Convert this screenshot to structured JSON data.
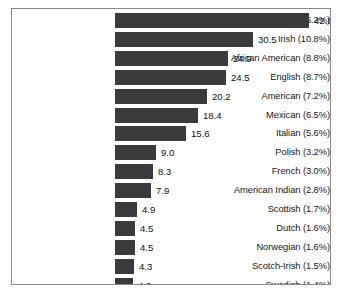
{
  "chart_data": {
    "type": "bar",
    "orientation": "horizontal",
    "title": "",
    "subtitle": "",
    "xlabel": "",
    "ylabel": "",
    "grid": false,
    "legend": null,
    "xlim": [
      0,
      42.8
    ],
    "value_format": "one-decimal",
    "bar_color": "#3b3b3b",
    "frame_color": "#8a8a8a",
    "background_color": "#ffffff",
    "categories": [
      "German (15.2%)",
      "Irish (10.8%)",
      "African American (8.8%)",
      "English (8.7%)",
      "American (7.2%)",
      "Mexican (6.5%)",
      "Italian (5.6%)",
      "Polish (3.2%)",
      "French (3.0%)",
      "American Indian (2.8%)",
      "Scottish (1.7%)",
      "Dutch (1.6%)",
      "Norwegian (1.6%)",
      "Scotch-Irish (1.5%)",
      "Swedish  (1.4%)"
    ],
    "values": [
      42.8,
      30.5,
      24.9,
      24.5,
      20.2,
      18.4,
      15.6,
      9.0,
      8.3,
      7.9,
      4.9,
      4.5,
      4.5,
      4.3,
      4.0
    ],
    "value_labels": [
      "42.8",
      "30.5",
      "24.9",
      "24.5",
      "20.2",
      "18.4",
      "15.6",
      "9.0",
      "8.3",
      "7.9",
      "4.9",
      "4.5",
      "4.5",
      "4.3",
      "4.0"
    ],
    "percent_labels": [
      "15.2%",
      "10.8%",
      "8.8%",
      "8.7%",
      "7.2%",
      "6.5%",
      "5.6%",
      "3.2%",
      "3.0%",
      "2.8%",
      "1.7%",
      "1.6%",
      "1.6%",
      "1.5%",
      "1.4%"
    ],
    "group_names": [
      "German",
      "Irish",
      "African American",
      "English",
      "American",
      "Mexican",
      "Italian",
      "Polish",
      "French",
      "American Indian",
      "Scottish",
      "Dutch",
      "Norwegian",
      "Scotch-Irish",
      "Swedish"
    ]
  }
}
